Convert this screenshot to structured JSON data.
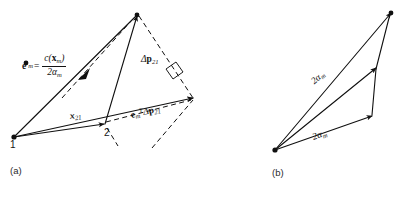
{
  "figure": {
    "background_color": "#ffffff",
    "ink_color": "#101010",
    "panels": [
      {
        "id": "a",
        "caption": "(a)",
        "vertex_labels": [
          {
            "name": "vertex-1",
            "text": "1"
          },
          {
            "name": "vertex-2",
            "text": "2"
          }
        ],
        "labels": {
          "e_m_definition": {
            "lhs": "e",
            "lhs_sub": "m",
            "equals": "=",
            "numerator_fn": "c(",
            "numerator_vec": "x",
            "numerator_vec_sub": "m",
            "numerator_close": ")",
            "denominator_coeff": "2",
            "denominator_sym": "α",
            "denominator_sub": "m"
          },
          "delta_p21": {
            "delta": "Δ",
            "vec": "p",
            "sub": "21"
          },
          "x21": {
            "vec": "x",
            "sub": "21"
          },
          "projection": {
            "vec": "e",
            "sub": "m",
            "sup": "T",
            "delta": "Δ",
            "vec2": "p",
            "sub2": "21"
          },
          "right_angle_marker": "right-angle-square"
        }
      },
      {
        "id": "b",
        "caption": "(b)",
        "labels": {
          "upper_edge": {
            "coeff": "2",
            "sym": "α",
            "sub": "m"
          },
          "lower_edge": {
            "coeff": "2",
            "sym": "α",
            "sub": "m"
          }
        }
      }
    ]
  }
}
